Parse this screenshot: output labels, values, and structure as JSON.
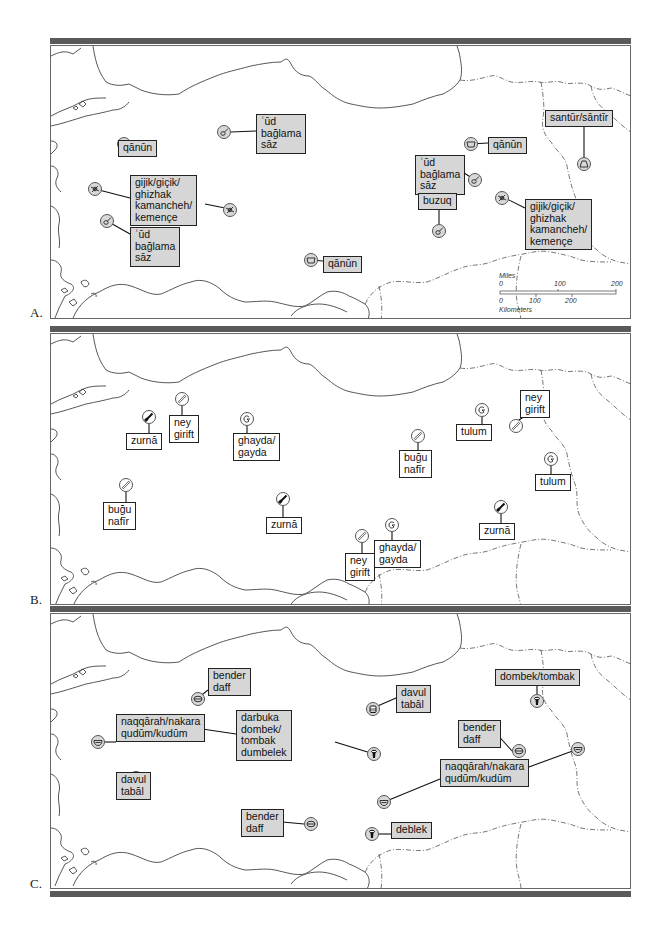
{
  "panels": [
    {
      "letter": "A.",
      "instrument_family": "chordophones",
      "labels": [
        {
          "id": "a1",
          "text": "qānūn",
          "x": 67,
          "y": 94,
          "shaded": true
        },
        {
          "id": "a2",
          "text": "ʿūd\nbağlama\nsāz",
          "x": 205,
          "y": 68,
          "shaded": true
        },
        {
          "id": "a3",
          "text": "gijik/giçik/\nghizhak\nkamancheh/\nkemençe",
          "x": 79,
          "y": 129,
          "shaded": true
        },
        {
          "id": "a4",
          "text": "ʿūd\nbağlama\nsāz",
          "x": 79,
          "y": 181,
          "shaded": true
        },
        {
          "id": "a5",
          "text": "qānūn",
          "x": 272,
          "y": 210,
          "shaded": true
        },
        {
          "id": "a6",
          "text": "qānūn",
          "x": 437,
          "y": 91,
          "shaded": true
        },
        {
          "id": "a7",
          "text": "santūr/sāntīr",
          "x": 494,
          "y": 64,
          "shaded": true
        },
        {
          "id": "a8",
          "text": "ʿūd\nbağlama\nsāz",
          "x": 364,
          "y": 109,
          "shaded": true
        },
        {
          "id": "a9",
          "text": "buzuq",
          "x": 367,
          "y": 147,
          "shaded": true
        },
        {
          "id": "a10",
          "text": "gijik/giçik/\nghizhak\nkamancheh/\nkemençe",
          "x": 474,
          "y": 153,
          "shaded": true
        }
      ],
      "symbols": [
        {
          "icon": "box-zither-icon",
          "x": 66,
          "y": 91,
          "shaded": true
        },
        {
          "icon": "lute-icon",
          "x": 166,
          "y": 79,
          "shaded": true
        },
        {
          "icon": "spike-fiddle-icon",
          "x": 37,
          "y": 136,
          "shaded": true
        },
        {
          "icon": "spike-fiddle-icon",
          "x": 172,
          "y": 157,
          "shaded": true
        },
        {
          "icon": "lute-icon",
          "x": 49,
          "y": 168,
          "shaded": true
        },
        {
          "icon": "box-zither-icon",
          "x": 253,
          "y": 207,
          "shaded": true
        },
        {
          "icon": "box-zither-icon",
          "x": 413,
          "y": 91,
          "shaded": true
        },
        {
          "icon": "dulcimer-icon",
          "x": 526,
          "y": 111,
          "shaded": true
        },
        {
          "icon": "lute-icon",
          "x": 417,
          "y": 127,
          "shaded": true
        },
        {
          "icon": "spike-fiddle-icon",
          "x": 444,
          "y": 145,
          "shaded": true
        },
        {
          "icon": "lute-icon",
          "x": 381,
          "y": 178,
          "shaded": true
        }
      ],
      "scale_bar": {
        "miles_label": "Miles",
        "miles_ticks": [
          "0",
          "100",
          "200"
        ],
        "km_ticks": [
          "0",
          "100",
          "200"
        ],
        "km_label": "Kilometers"
      }
    },
    {
      "letter": "B.",
      "instrument_family": "aerophones",
      "labels": [
        {
          "id": "b1",
          "text": "zurnā",
          "x": 75,
          "y": 99,
          "shaded": false
        },
        {
          "id": "b2",
          "text": "ney\ngirift",
          "x": 118,
          "y": 81,
          "shaded": false
        },
        {
          "id": "b3",
          "text": "ghayda/\ngayda",
          "x": 182,
          "y": 99,
          "shaded": false
        },
        {
          "id": "b4",
          "text": "buğu\nnafīr",
          "x": 52,
          "y": 168,
          "shaded": false
        },
        {
          "id": "b5",
          "text": "zurnā",
          "x": 215,
          "y": 183,
          "shaded": false
        },
        {
          "id": "b6",
          "text": "buğu\nnafīr",
          "x": 348,
          "y": 116,
          "shaded": false
        },
        {
          "id": "b7",
          "text": "tulum",
          "x": 405,
          "y": 90,
          "shaded": false
        },
        {
          "id": "b8",
          "text": "ney\ngirift",
          "x": 469,
          "y": 56,
          "shaded": false
        },
        {
          "id": "b9",
          "text": "tulum",
          "x": 484,
          "y": 140,
          "shaded": false
        },
        {
          "id": "b10",
          "text": "zurnā",
          "x": 428,
          "y": 189,
          "shaded": false
        },
        {
          "id": "b11",
          "text": "ghayda/\ngayda",
          "x": 323,
          "y": 206,
          "shaded": false
        },
        {
          "id": "b12",
          "text": "ney\ngirift",
          "x": 294,
          "y": 219,
          "shaded": false
        }
      ],
      "symbols": [
        {
          "icon": "shawm-icon",
          "x": 91,
          "y": 76,
          "shaded": false
        },
        {
          "icon": "flute-icon",
          "x": 124,
          "y": 58,
          "shaded": false
        },
        {
          "icon": "bagpipe-icon",
          "x": 189,
          "y": 78,
          "shaded": false
        },
        {
          "icon": "flute-icon",
          "x": 68,
          "y": 144,
          "shaded": false
        },
        {
          "icon": "shawm-icon",
          "x": 225,
          "y": 158,
          "shaded": false
        },
        {
          "icon": "flute-icon",
          "x": 360,
          "y": 95,
          "shaded": false
        },
        {
          "icon": "bagpipe-icon",
          "x": 424,
          "y": 69,
          "shaded": false
        },
        {
          "icon": "flute-icon",
          "x": 458,
          "y": 85,
          "shaded": false
        },
        {
          "icon": "bagpipe-icon",
          "x": 493,
          "y": 118,
          "shaded": false
        },
        {
          "icon": "shawm-icon",
          "x": 443,
          "y": 166,
          "shaded": false
        },
        {
          "icon": "bagpipe-icon",
          "x": 334,
          "y": 184,
          "shaded": false
        },
        {
          "icon": "flute-icon",
          "x": 304,
          "y": 195,
          "shaded": false
        }
      ]
    },
    {
      "letter": "C.",
      "instrument_family": "membranophones",
      "labels": [
        {
          "id": "c1",
          "text": "bender\ndaff",
          "x": 157,
          "y": 54,
          "shaded": true
        },
        {
          "id": "c2",
          "text": "naqqārah/nakara\nqudūm/kudūm",
          "x": 65,
          "y": 100,
          "shaded": true
        },
        {
          "id": "c3",
          "text": "darbuka\ndombek/\ntombak\ndumbelek",
          "x": 185,
          "y": 96,
          "shaded": true
        },
        {
          "id": "c4",
          "text": "davul\ntabāl",
          "x": 65,
          "y": 158,
          "shaded": true
        },
        {
          "id": "c5",
          "text": "bender\ndaff",
          "x": 190,
          "y": 195,
          "shaded": true
        },
        {
          "id": "c6",
          "text": "davul\ntabāl",
          "x": 345,
          "y": 71,
          "shaded": true
        },
        {
          "id": "c7",
          "text": "dombek/tombak",
          "x": 444,
          "y": 55,
          "shaded": true
        },
        {
          "id": "c8",
          "text": "bender\ndaff",
          "x": 407,
          "y": 106,
          "shaded": true
        },
        {
          "id": "c9",
          "text": "naqqārah/nakara\nqudūm/kudūm",
          "x": 389,
          "y": 145,
          "shaded": true
        },
        {
          "id": "c10",
          "text": "deblek",
          "x": 340,
          "y": 208,
          "shaded": true
        }
      ],
      "symbols": [
        {
          "icon": "frame-drum-icon",
          "x": 140,
          "y": 78,
          "shaded": true
        },
        {
          "icon": "goblet-drum-icon",
          "x": 90,
          "y": 100,
          "shaded": true
        },
        {
          "icon": "kettle-drum-icon",
          "x": 40,
          "y": 121,
          "shaded": true
        },
        {
          "icon": "double-headed-drum-icon",
          "x": 78,
          "y": 157,
          "shaded": true
        },
        {
          "icon": "frame-drum-icon",
          "x": 253,
          "y": 203,
          "shaded": true
        },
        {
          "icon": "double-headed-drum-icon",
          "x": 315,
          "y": 88,
          "shaded": true
        },
        {
          "icon": "goblet-drum-icon",
          "x": 316,
          "y": 133,
          "shaded": true
        },
        {
          "icon": "goblet-drum-icon",
          "x": 479,
          "y": 80,
          "shaded": true
        },
        {
          "icon": "frame-drum-icon",
          "x": 461,
          "y": 130,
          "shaded": true
        },
        {
          "icon": "kettle-drum-icon",
          "x": 520,
          "y": 128,
          "shaded": true
        },
        {
          "icon": "kettle-drum-icon",
          "x": 326,
          "y": 181,
          "shaded": true
        },
        {
          "icon": "goblet-drum-icon",
          "x": 314,
          "y": 213,
          "shaded": true
        }
      ]
    }
  ]
}
